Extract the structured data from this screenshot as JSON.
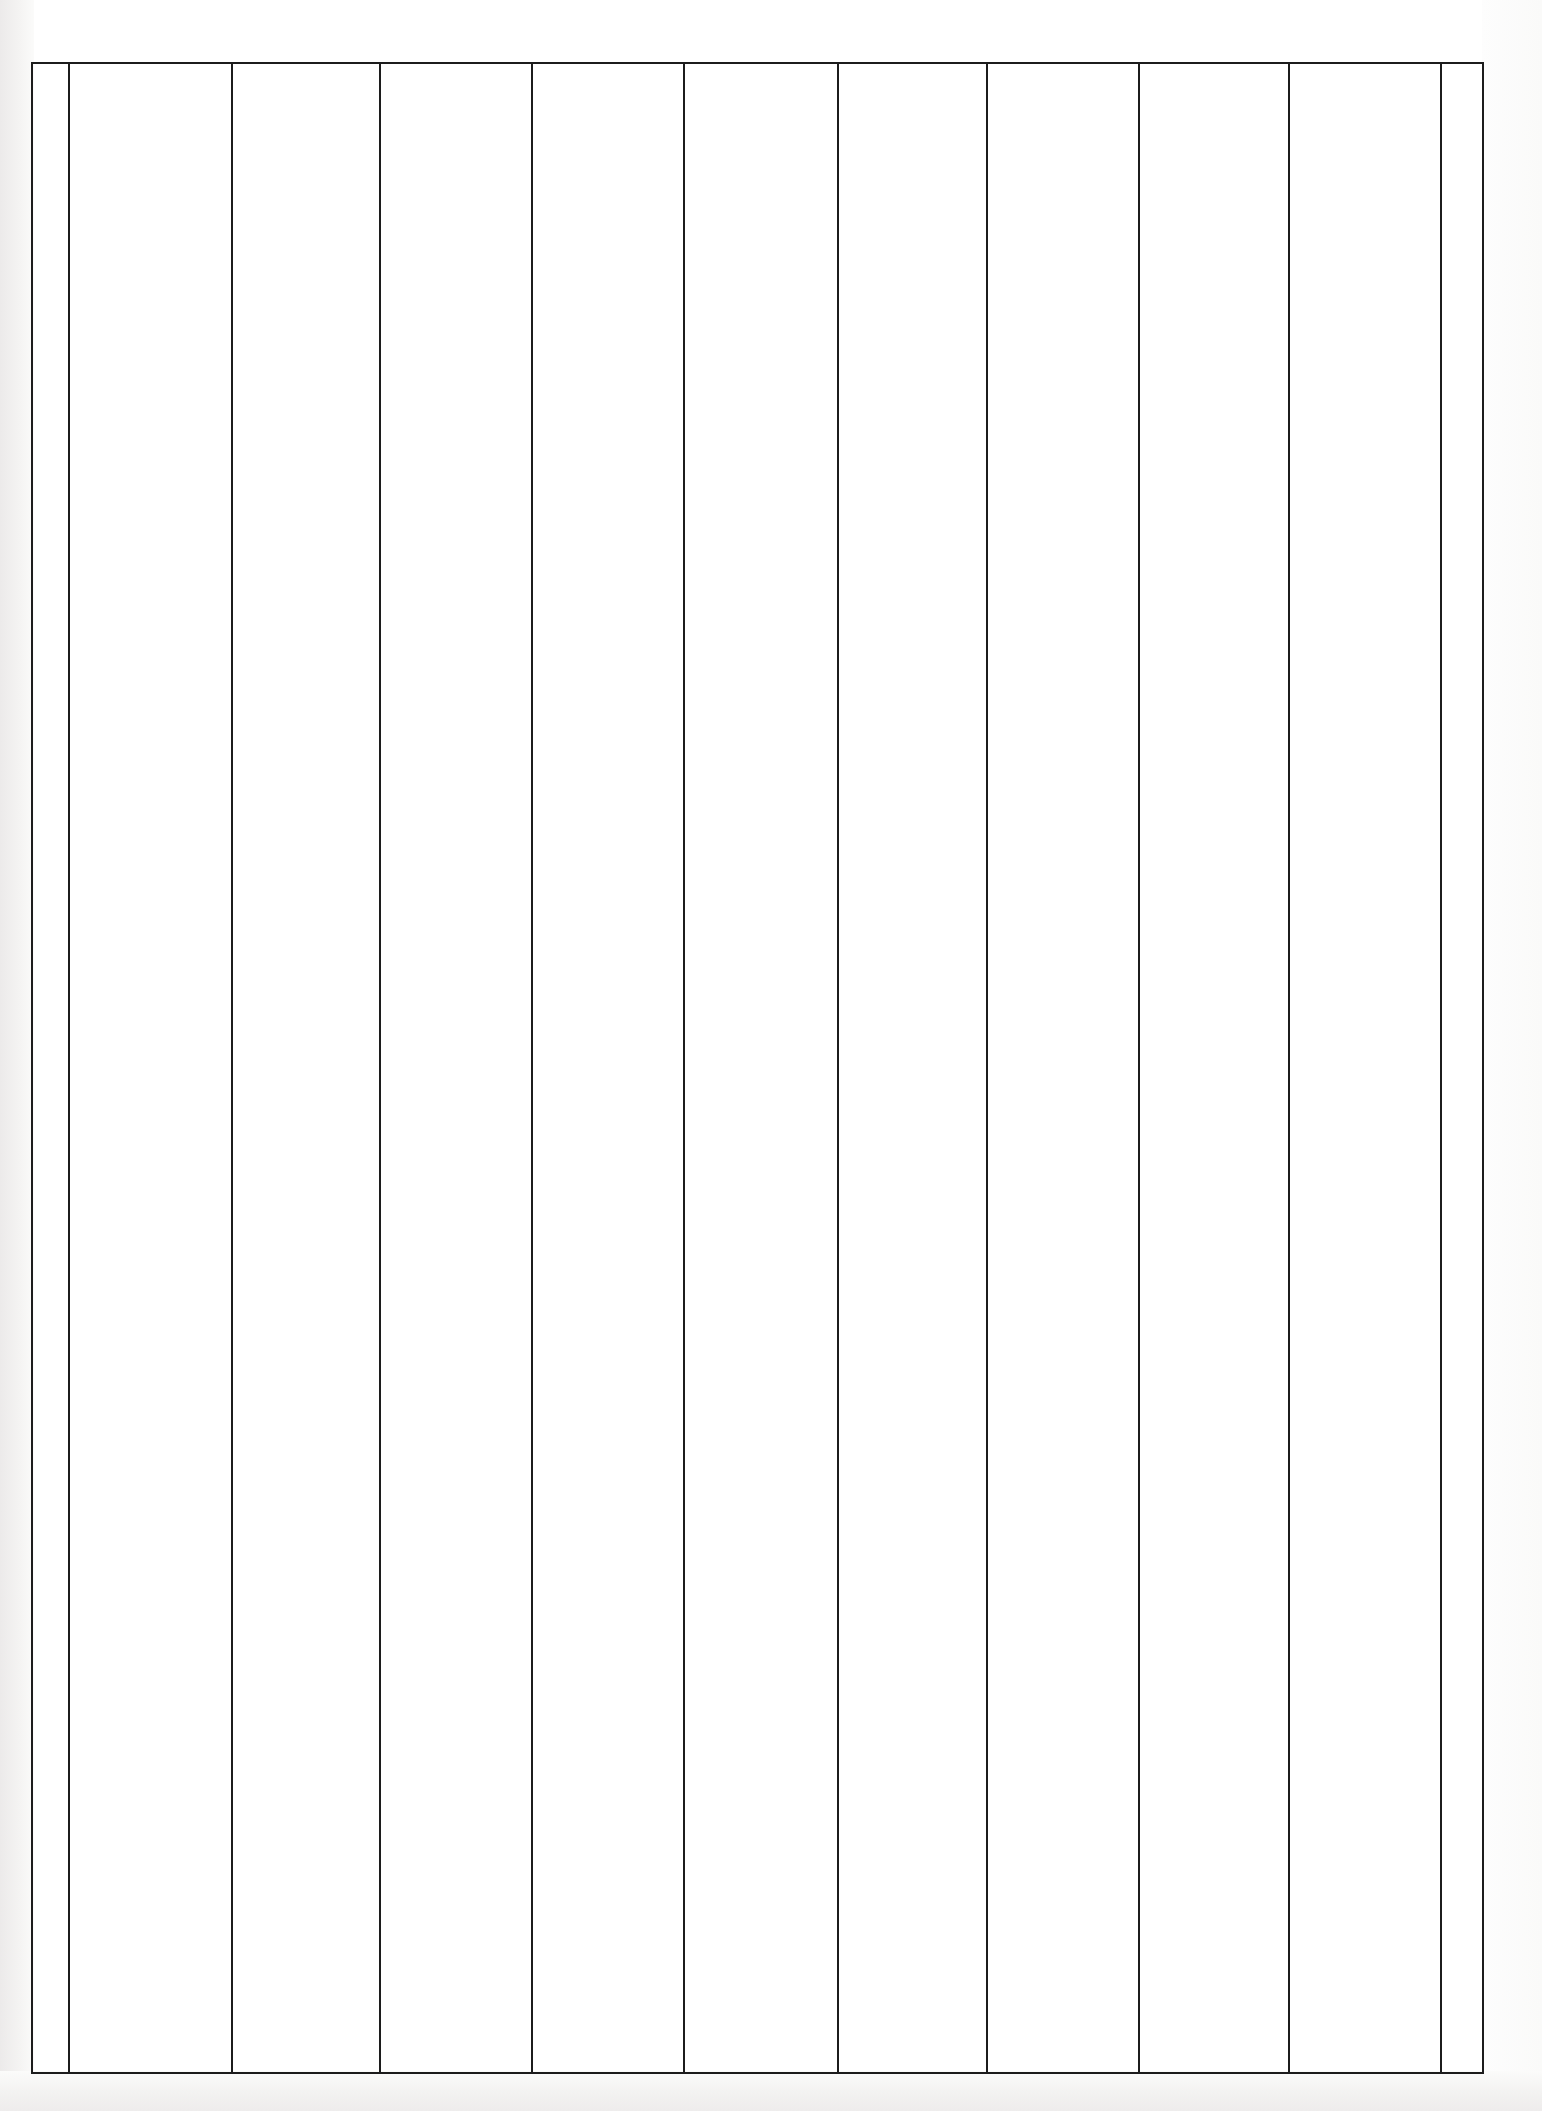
{
  "document": {
    "kind": "scanned-blank-ruled-table",
    "page_background_color": "#ffffff",
    "rule_color": "#1c1c1c",
    "page_width": 1542,
    "page_height": 2111,
    "title_text": "",
    "caption_text": "",
    "header_row_text": "",
    "footer_text": "",
    "page_number_text": "",
    "notes_text": ""
  },
  "table": {
    "bounds": {
      "left": 31,
      "top": 62,
      "right": 1484,
      "bottom": 2074
    },
    "horizontal_rules": [
      {
        "name": "top-border",
        "y": 62,
        "x_start": 31,
        "x_end": 1484
      },
      {
        "name": "bottom-border",
        "y": 2072,
        "x_start": 31,
        "x_end": 1484
      }
    ],
    "vertical_rules": [
      {
        "name": "left-border",
        "x": 31
      },
      {
        "name": "rule-2",
        "x": 68
      },
      {
        "name": "rule-3",
        "x": 231
      },
      {
        "name": "rule-4",
        "x": 379
      },
      {
        "name": "rule-5",
        "x": 531
      },
      {
        "name": "rule-6",
        "x": 683
      },
      {
        "name": "rule-7",
        "x": 837
      },
      {
        "name": "rule-8",
        "x": 986
      },
      {
        "name": "rule-9",
        "x": 1138
      },
      {
        "name": "rule-10",
        "x": 1288
      },
      {
        "name": "rule-11",
        "x": 1440
      },
      {
        "name": "right-border",
        "x": 1482
      }
    ],
    "column_headers": [
      "",
      "",
      "",
      "",
      "",
      "",
      "",
      "",
      "",
      "",
      ""
    ],
    "columns": [
      {
        "index": 1,
        "name": "column-1",
        "left": 31,
        "width": 37,
        "cells": [
          ""
        ]
      },
      {
        "index": 2,
        "name": "column-2",
        "left": 68,
        "width": 163,
        "cells": [
          ""
        ]
      },
      {
        "index": 3,
        "name": "column-3",
        "left": 231,
        "width": 148,
        "cells": [
          ""
        ]
      },
      {
        "index": 4,
        "name": "column-4",
        "left": 379,
        "width": 152,
        "cells": [
          ""
        ]
      },
      {
        "index": 5,
        "name": "column-5",
        "left": 531,
        "width": 152,
        "cells": [
          ""
        ]
      },
      {
        "index": 6,
        "name": "column-6",
        "left": 683,
        "width": 154,
        "cells": [
          ""
        ]
      },
      {
        "index": 7,
        "name": "column-7",
        "left": 837,
        "width": 149,
        "cells": [
          ""
        ]
      },
      {
        "index": 8,
        "name": "column-8",
        "left": 986,
        "width": 152,
        "cells": [
          ""
        ]
      },
      {
        "index": 9,
        "name": "column-9",
        "left": 1138,
        "width": 150,
        "cells": [
          ""
        ]
      },
      {
        "index": 10,
        "name": "column-10",
        "left": 1288,
        "width": 152,
        "cells": [
          ""
        ]
      },
      {
        "index": 11,
        "name": "column-11",
        "left": 1440,
        "width": 42,
        "cells": [
          ""
        ]
      }
    ],
    "row_count_visible": 0,
    "data_rows": []
  }
}
